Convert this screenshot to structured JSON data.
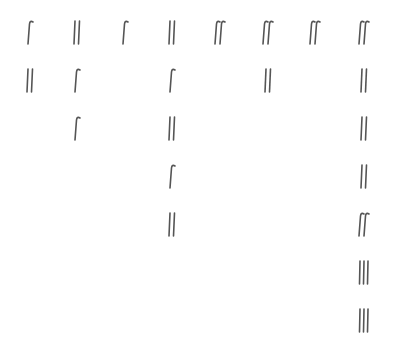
{
  "grid": {
    "columns_x": [
      30,
      77,
      125,
      172,
      220,
      268,
      315,
      364
    ],
    "rows_y": [
      32,
      80,
      128,
      176,
      224,
      272,
      320
    ],
    "ink_color": "#555555",
    "columns": [
      [
        "hook",
        "double-bar"
      ],
      [
        "double-bar",
        "hook",
        "hook"
      ],
      [
        "hook"
      ],
      [
        "double-bar",
        "hook",
        "double-bar",
        "hook",
        "double-bar"
      ],
      [
        "double-hook"
      ],
      [
        "double-hook",
        "double-bar"
      ],
      [
        "double-hook"
      ],
      [
        "double-hook",
        "double-bar",
        "double-bar",
        "double-bar",
        "double-hook",
        "triple-bar",
        "triple-bar"
      ]
    ]
  }
}
